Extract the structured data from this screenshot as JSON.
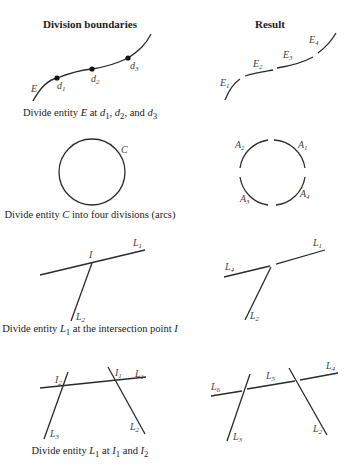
{
  "headers": {
    "left": "Division boundaries",
    "right": "Result"
  },
  "rows": [
    {
      "caption": {
        "pre": "Divide entity ",
        "entity": "E",
        "post": " at d1, d2, and d3"
      },
      "caption_text": "Divide entity E at d1, d2, and d3",
      "left_labels": [
        "E",
        "d1",
        "d2",
        "d3"
      ],
      "right_labels": [
        "E1",
        "E2",
        "E3",
        "E4"
      ]
    },
    {
      "caption_text": "Divide entity C into four divisions (arcs)",
      "left_labels": [
        "C"
      ],
      "right_labels": [
        "A1",
        "A2",
        "A3",
        "A4"
      ]
    },
    {
      "caption_text": "Divide entity L1 at the intersection point I",
      "left_labels": [
        "I",
        "L1",
        "L2"
      ],
      "right_labels": [
        "L1",
        "L4",
        "L2"
      ]
    },
    {
      "caption_text": "Divide entity L1 at I1 and I2",
      "left_labels": [
        "I1",
        "I2",
        "L1",
        "L2",
        "L3"
      ],
      "right_labels": [
        "L4",
        "L5",
        "L6",
        "L2",
        "L3"
      ]
    }
  ],
  "captions": {
    "row1": {
      "a": "Divide entity ",
      "b": "E",
      "c": " at ",
      "d": "d",
      "d_sub": "1",
      "e": ", ",
      "f": "d",
      "f_sub": "2",
      "g": ", and ",
      "h": "d",
      "h_sub": "3"
    },
    "row2": {
      "a": "Divide entity ",
      "b": "C",
      "c": " into four divisions (arcs)"
    },
    "row3": {
      "a": "Divide entity ",
      "b": "L",
      "b_sub": "1",
      "c": " at the intersection point ",
      "d": "I"
    },
    "row4": {
      "a": "Divide entity ",
      "b": "L",
      "b_sub": "1",
      "c": " at ",
      "d": "I",
      "d_sub": "1",
      "e": " and ",
      "f": "I",
      "f_sub": "2"
    }
  },
  "labels": {
    "E": "E",
    "d": "d",
    "C": "C",
    "A": "A",
    "L": "L",
    "I": "I",
    "s1": "1",
    "s2": "2",
    "s3": "3",
    "s4": "4",
    "s5": "5",
    "s6": "6"
  },
  "colors": {
    "stroke": "#2b2b2b",
    "text": "#444444",
    "background": "#ffffff"
  }
}
